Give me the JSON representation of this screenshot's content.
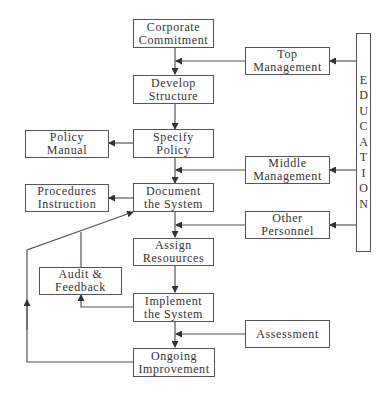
{
  "diagram": {
    "main_flow": [
      {
        "id": "corporate-commitment",
        "line1": "Corporate",
        "line2": "Commitment"
      },
      {
        "id": "develop-structure",
        "line1": "Develop",
        "line2": "Structure"
      },
      {
        "id": "specify-policy",
        "line1": "Specify",
        "line2": "Policy"
      },
      {
        "id": "document-system",
        "line1": "Document",
        "line2": "the System"
      },
      {
        "id": "assign-resources",
        "line1": "Assign",
        "line2": "Resouurces"
      },
      {
        "id": "implement-system",
        "line1": "Implement",
        "line2": "the System"
      },
      {
        "id": "ongoing-improvement",
        "line1": "Ongoing",
        "line2": "Improvement"
      }
    ],
    "outputs": [
      {
        "id": "policy-manual",
        "line1": "Policy",
        "line2": "Manual"
      },
      {
        "id": "procedures-instruction",
        "line1": "Procedures",
        "line2": "Instruction"
      },
      {
        "id": "audit-feedback",
        "line1": "Audit &",
        "line2": "Feedback"
      }
    ],
    "inputs": [
      {
        "id": "top-management",
        "line1": "Top",
        "line2": "Management"
      },
      {
        "id": "middle-management",
        "line1": "Middle",
        "line2": "Management"
      },
      {
        "id": "other-personnel",
        "line1": "Other",
        "line2": "Personnel"
      },
      {
        "id": "assessment",
        "line1": "Assessment"
      }
    ],
    "education": {
      "label": "EDUCATION",
      "letters": [
        "E",
        "D",
        "U",
        "C",
        "A",
        "T",
        "I",
        "O",
        "N"
      ]
    },
    "colors": {
      "line": "#555555",
      "text": "#333333",
      "background": "#ffffff"
    }
  }
}
